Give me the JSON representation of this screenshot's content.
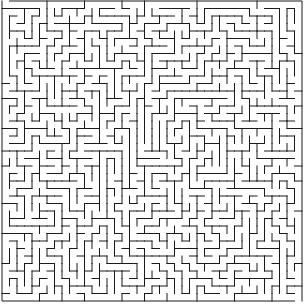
{
  "maze": {
    "cols": 40,
    "rows": 40,
    "cell_size": 7.5,
    "origin_x": 2,
    "origin_y": 1,
    "wall_color": "#1a1a1a",
    "background_color": "#ffffff",
    "wall_width": 1,
    "seed": 20240611
  }
}
